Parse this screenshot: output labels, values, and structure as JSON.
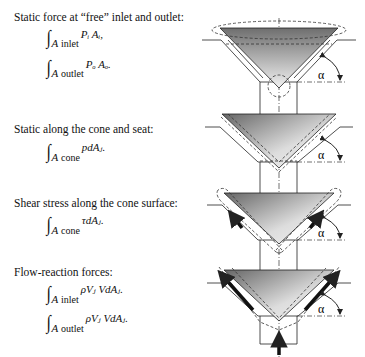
{
  "sections": [
    {
      "label": "Static force at “free” inlet and outlet:",
      "equations": [
        {
          "integral": "∫",
          "area_var": "A",
          "region": "inlet",
          "integrand": "Pᵢ Aᵢ,"
        },
        {
          "integral": "∫",
          "area_var": "A",
          "region": "outlet",
          "integrand": "Pₒ Aₒ."
        }
      ]
    },
    {
      "label": "Static along the cone and seat:",
      "equations": [
        {
          "integral": "∫",
          "area_var": "A",
          "region": "cone",
          "integrand": "pdAⱼ."
        }
      ]
    },
    {
      "label": "Shear stress along the cone surface:",
      "equations": [
        {
          "integral": "∫",
          "area_var": "A",
          "region": "cone",
          "integrand": "τdAⱼ."
        }
      ]
    },
    {
      "label": "Flow-reaction forces:",
      "equations": [
        {
          "integral": "∫",
          "area_var": "A",
          "region": "inlet",
          "integrand": "ρVⱼ VdAⱼ."
        },
        {
          "integral": "∫",
          "area_var": "A",
          "region": "outlet",
          "integrand": "ρVⱼ VdAⱼ."
        }
      ]
    }
  ],
  "diagram": {
    "angle_label": "α",
    "panels": [
      "free-inlet-outlet",
      "cone-and-seat-static",
      "cone-shear-stress",
      "flow-reaction"
    ],
    "colors": {
      "cone_dark": "#6e6e6e",
      "cone_light": "#f2f2f2",
      "line": "#222222",
      "dash": "#333333"
    }
  }
}
